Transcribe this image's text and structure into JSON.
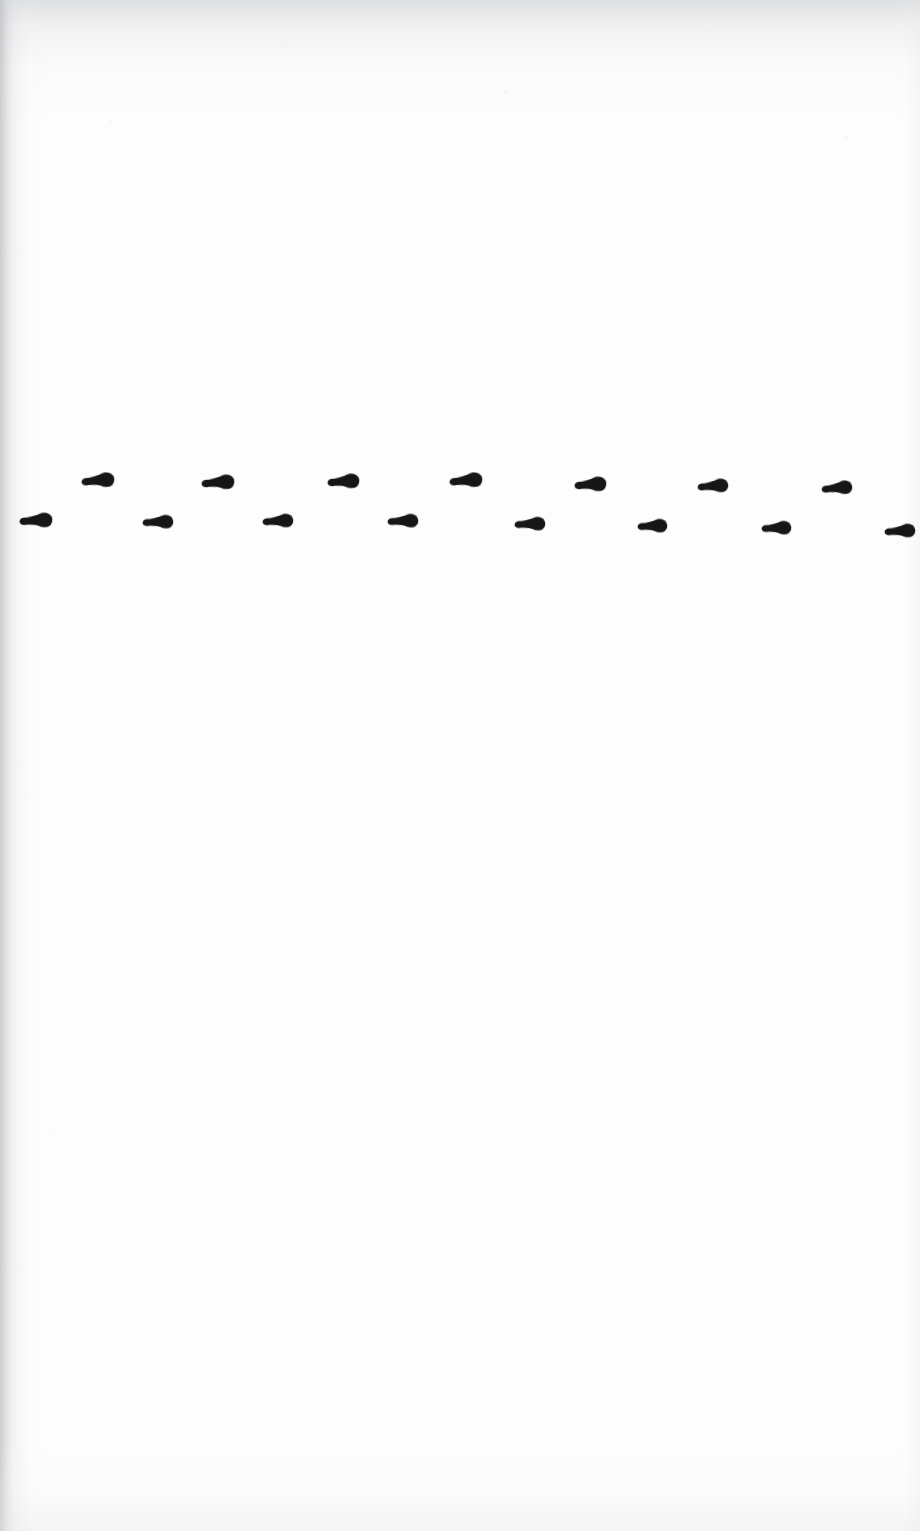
{
  "page": {
    "width": 920,
    "height": 1531,
    "background_color": "#fdfdfd",
    "paper_tone": "#fdfdfd",
    "edge_shadow_color": "#c6c8ca"
  },
  "ink": {
    "color": "#191919",
    "mark_shape_name": "dumbbell-stroke",
    "mark_count": 15,
    "stroke_style": "brush-pen dab with tapered tail left and heavier bulb right"
  },
  "chart_data": {
    "type": "scatter",
    "title": "",
    "subtitle": "",
    "xlabel": "",
    "ylabel": "",
    "grid": false,
    "legend": null,
    "axis_visible": false,
    "tick_labels_x": [],
    "tick_labels_y": [],
    "xlim": [
      0,
      920
    ],
    "ylim": [
      0,
      1531
    ],
    "note": "Pixel coordinates of each ink mark centre, in image space (y grows downward). Marks alternate between an upper row (~y 481) and a lower row (~y 523).",
    "series": [
      {
        "name": "upper-row-marks",
        "row": "upper",
        "count": 7,
        "x": [
          98,
          218,
          343,
          466,
          590,
          713,
          837
        ],
        "y": [
          480,
          482,
          481,
          480,
          484,
          486,
          488
        ]
      },
      {
        "name": "lower-row-marks",
        "row": "lower",
        "count": 8,
        "x": [
          36,
          158,
          278,
          403,
          530,
          652,
          776,
          900
        ],
        "y": [
          520,
          522,
          521,
          521,
          524,
          526,
          528,
          531
        ]
      }
    ],
    "marks": [
      {
        "index": 1,
        "row": "lower",
        "cx": 36,
        "cy": 520,
        "w": 32,
        "h": 15,
        "rotation": -4,
        "clipped": false
      },
      {
        "index": 2,
        "row": "upper",
        "cx": 98,
        "cy": 480,
        "w": 32,
        "h": 15,
        "rotation": -6,
        "clipped": false
      },
      {
        "index": 3,
        "row": "lower",
        "cx": 158,
        "cy": 522,
        "w": 30,
        "h": 14,
        "rotation": -3,
        "clipped": false
      },
      {
        "index": 4,
        "row": "upper",
        "cx": 218,
        "cy": 482,
        "w": 32,
        "h": 15,
        "rotation": -5,
        "clipped": false
      },
      {
        "index": 5,
        "row": "lower",
        "cx": 278,
        "cy": 521,
        "w": 30,
        "h": 14,
        "rotation": -4,
        "clipped": false
      },
      {
        "index": 6,
        "row": "upper",
        "cx": 343,
        "cy": 481,
        "w": 31,
        "h": 15,
        "rotation": -5,
        "clipped": false
      },
      {
        "index": 7,
        "row": "lower",
        "cx": 403,
        "cy": 521,
        "w": 30,
        "h": 14,
        "rotation": -3,
        "clipped": false
      },
      {
        "index": 8,
        "row": "upper",
        "cx": 466,
        "cy": 480,
        "w": 32,
        "h": 15,
        "rotation": -6,
        "clipped": false
      },
      {
        "index": 9,
        "row": "lower",
        "cx": 530,
        "cy": 524,
        "w": 30,
        "h": 14,
        "rotation": -3,
        "clipped": false
      },
      {
        "index": 10,
        "row": "upper",
        "cx": 590,
        "cy": 484,
        "w": 31,
        "h": 15,
        "rotation": -5,
        "clipped": false
      },
      {
        "index": 11,
        "row": "lower",
        "cx": 652,
        "cy": 526,
        "w": 29,
        "h": 14,
        "rotation": -3,
        "clipped": false
      },
      {
        "index": 12,
        "row": "upper",
        "cx": 713,
        "cy": 486,
        "w": 30,
        "h": 14,
        "rotation": -5,
        "clipped": false
      },
      {
        "index": 13,
        "row": "lower",
        "cx": 776,
        "cy": 528,
        "w": 29,
        "h": 14,
        "rotation": -3,
        "clipped": false
      },
      {
        "index": 14,
        "row": "upper",
        "cx": 837,
        "cy": 488,
        "w": 30,
        "h": 14,
        "rotation": -6,
        "clipped": false
      },
      {
        "index": 15,
        "row": "lower",
        "cx": 900,
        "cy": 531,
        "w": 30,
        "h": 14,
        "rotation": -4,
        "clipped": true
      }
    ]
  }
}
